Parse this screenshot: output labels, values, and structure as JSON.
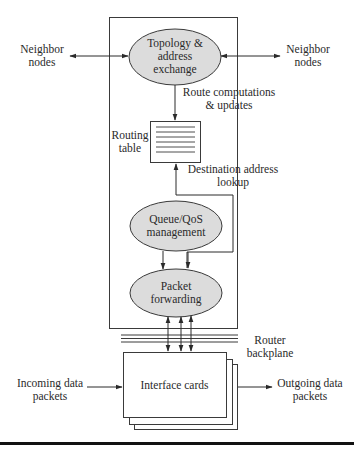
{
  "diagram": {
    "type": "router architecture block diagram",
    "colors": {
      "ellipse_fill": "#dcdcdc",
      "stroke": "#3a3a3a",
      "background": "#ffffff",
      "bottom_rule": "#111111"
    },
    "nodes": {
      "topology": {
        "line1": "Topology &",
        "line2": "address",
        "line3": "exchange"
      },
      "routing_table": {
        "line1": "Routing",
        "line2": "table"
      },
      "queue": {
        "line1": "Queue/QoS",
        "line2": "management"
      },
      "forwarding": {
        "line1": "Packet",
        "line2": "forwarding"
      },
      "interface_cards": {
        "label": "Interface cards"
      }
    },
    "labels": {
      "neighbor_left": {
        "line1": "Neighbor",
        "line2": "nodes"
      },
      "neighbor_right": {
        "line1": "Neighbor",
        "line2": "nodes"
      },
      "route_updates": {
        "line1": "Route computations",
        "line2": "& updates"
      },
      "dest_lookup": {
        "line1": "Destination address",
        "line2": "lookup"
      },
      "backplane": {
        "line1": "Router",
        "line2": "backplane"
      },
      "incoming": {
        "line1": "Incoming data",
        "line2": "packets"
      },
      "outgoing": {
        "line1": "Outgoing data",
        "line2": "packets"
      }
    },
    "edges": [
      {
        "from": "Neighbor nodes (left)",
        "to": "Topology & address exchange",
        "direction": "bidirectional"
      },
      {
        "from": "Topology & address exchange",
        "to": "Neighbor nodes (right)",
        "direction": "bidirectional"
      },
      {
        "from": "Topology & address exchange",
        "to": "Routing table",
        "label": "Route computations & updates"
      },
      {
        "from": "Packet forwarding",
        "to": "Routing table",
        "label": "Destination address lookup"
      },
      {
        "from": "Queue/QoS management",
        "to": "Packet forwarding"
      },
      {
        "from": "Packet forwarding",
        "to": "Interface cards",
        "via": "Router backplane",
        "direction": "bidirectional",
        "count": 3
      },
      {
        "from": "Incoming data packets",
        "to": "Interface cards"
      },
      {
        "from": "Interface cards",
        "to": "Outgoing data packets"
      }
    ]
  }
}
